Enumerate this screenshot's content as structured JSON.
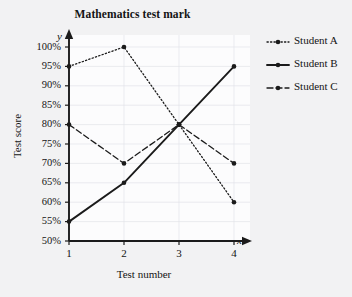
{
  "chart_data": {
    "type": "line",
    "title": "Mathematics test mark",
    "xlabel": "Test number",
    "ylabel": "Test score",
    "x_axis_variable": "x",
    "y_axis_variable": "y",
    "categories": [
      1,
      2,
      3,
      4
    ],
    "x_tick_labels": [
      "1",
      "2",
      "3",
      "4"
    ],
    "y_tick_labels": [
      "50%",
      "55%",
      "60%",
      "65%",
      "70%",
      "75%",
      "80%",
      "85%",
      "90%",
      "95%",
      "100%"
    ],
    "y_tick_values": [
      50,
      55,
      60,
      65,
      70,
      75,
      80,
      85,
      90,
      95,
      100
    ],
    "xlim": [
      1,
      4
    ],
    "ylim": [
      50,
      100
    ],
    "grid": true,
    "legend_position": "right",
    "series": [
      {
        "name": "Student A",
        "values": [
          95,
          100,
          80,
          60
        ],
        "style": "dotted",
        "color": "#1b1b1b",
        "marker": "circle"
      },
      {
        "name": "Student B",
        "values": [
          55,
          65,
          80,
          95
        ],
        "style": "solid",
        "color": "#1b1b1b",
        "marker": "circle"
      },
      {
        "name": "Student C",
        "values": [
          80,
          70,
          80,
          70
        ],
        "style": "dashed",
        "color": "#1b1b1b",
        "marker": "circle"
      }
    ]
  },
  "colors": {
    "page_background": "#f2f2f3",
    "plot_background": "#fcfcfd",
    "ink": "#1b1b1b",
    "grid": "#e2e4ea"
  }
}
